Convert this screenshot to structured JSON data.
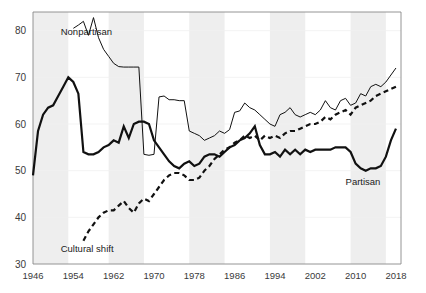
{
  "chart_data": {
    "type": "line",
    "title": "",
    "subtitle": "",
    "xlabel": "",
    "ylabel": "",
    "xlim": [
      1946,
      2019
    ],
    "ylim": [
      30,
      84
    ],
    "grid": false,
    "legend_position": "inline-annotations",
    "xticks": [
      "1946",
      "1954",
      "1962",
      "1970",
      "1978",
      "1986",
      "1994",
      "2002",
      "2010",
      "2018"
    ],
    "xtick_values": [
      1946,
      1954,
      1962,
      1970,
      1978,
      1986,
      1994,
      2002,
      2010,
      2018
    ],
    "yticks": [
      "30",
      "40",
      "50",
      "60",
      "70",
      "80"
    ],
    "ytick_values": [
      30,
      40,
      50,
      60,
      70,
      80
    ],
    "shaded_bands": [
      {
        "start": 1946,
        "end": 1953
      },
      {
        "start": 1961,
        "end": 1968
      },
      {
        "start": 1977,
        "end": 1984
      },
      {
        "start": 1993,
        "end": 2000
      },
      {
        "start": 2009,
        "end": 2016
      }
    ],
    "series": [
      {
        "name": "Nonpartisan",
        "style": "thin-solid",
        "color": "#111111",
        "label_x": 1951.5,
        "label_y": 79.0,
        "x": [
          1954,
          1955,
          1956,
          1957,
          1958,
          1959,
          1960,
          1961,
          1962,
          1963,
          1964,
          1965,
          1966,
          1967,
          1968,
          1969,
          1970,
          1971,
          1972,
          1973,
          1974,
          1975,
          1976,
          1977,
          1978,
          1979,
          1980,
          1981,
          1982,
          1983,
          1984,
          1985,
          1986,
          1987,
          1988,
          1989,
          1990,
          1991,
          1992,
          1993,
          1994,
          1995,
          1996,
          1997,
          1998,
          1999,
          2000,
          2001,
          2002,
          2003,
          2004,
          2005,
          2006,
          2007,
          2008,
          2009,
          2010,
          2011,
          2012,
          2013,
          2014,
          2015,
          2016,
          2017,
          2018
        ],
        "values": [
          80.5,
          81.2,
          82.0,
          79.0,
          82.8,
          78.5,
          76.0,
          74.5,
          73.0,
          72.3,
          72.2,
          72.2,
          72.2,
          72.2,
          53.5,
          53.3,
          53.5,
          65.8,
          66.0,
          65.2,
          65.2,
          65.0,
          65.0,
          58.5,
          58.0,
          57.5,
          56.5,
          57.0,
          57.5,
          58.5,
          58.0,
          58.8,
          62.5,
          62.8,
          64.5,
          63.5,
          63.0,
          62.0,
          61.0,
          60.0,
          59.5,
          62.0,
          62.5,
          63.5,
          62.0,
          61.5,
          62.0,
          62.5,
          62.0,
          63.0,
          65.0,
          63.5,
          63.0,
          65.0,
          65.5,
          64.0,
          64.5,
          66.5,
          66.0,
          68.0,
          68.5,
          68.0,
          69.0,
          70.5,
          72.0
        ]
      },
      {
        "name": "Partisan",
        "style": "thick-solid",
        "color": "#111111",
        "label_x": 2008.0,
        "label_y": 47.0,
        "x": [
          1946,
          1947,
          1948,
          1949,
          1950,
          1951,
          1952,
          1953,
          1954,
          1955,
          1956,
          1957,
          1958,
          1959,
          1960,
          1961,
          1962,
          1963,
          1964,
          1965,
          1966,
          1967,
          1968,
          1969,
          1970,
          1971,
          1972,
          1973,
          1974,
          1975,
          1976,
          1977,
          1978,
          1979,
          1980,
          1981,
          1982,
          1983,
          1984,
          1985,
          1986,
          1987,
          1988,
          1989,
          1990,
          1991,
          1992,
          1993,
          1994,
          1995,
          1996,
          1997,
          1998,
          1999,
          2000,
          2001,
          2002,
          2003,
          2004,
          2005,
          2006,
          2007,
          2008,
          2009,
          2010,
          2011,
          2012,
          2013,
          2014,
          2015,
          2016,
          2017,
          2018
        ],
        "values": [
          49.0,
          58.5,
          62.0,
          63.5,
          64.0,
          66.0,
          68.0,
          70.0,
          69.0,
          66.5,
          54.0,
          53.5,
          53.5,
          54.0,
          55.0,
          55.5,
          56.5,
          56.0,
          59.5,
          57.0,
          60.0,
          60.5,
          60.5,
          60.0,
          56.5,
          55.0,
          53.5,
          52.0,
          51.0,
          50.5,
          51.5,
          52.0,
          51.0,
          51.5,
          53.0,
          53.5,
          53.5,
          53.0,
          54.0,
          55.0,
          55.5,
          56.5,
          57.0,
          58.0,
          59.5,
          55.5,
          53.5,
          53.5,
          54.0,
          53.0,
          54.5,
          53.5,
          54.5,
          53.5,
          54.5,
          54.0,
          54.5,
          54.5,
          54.5,
          54.5,
          55.0,
          55.0,
          55.0,
          54.0,
          51.5,
          50.5,
          50.0,
          50.5,
          50.5,
          51.0,
          53.0,
          56.5,
          59.0
        ]
      },
      {
        "name": "Cultural shift",
        "style": "dashed",
        "color": "#111111",
        "label_x": 1951.5,
        "label_y": 32.5,
        "x": [
          1956,
          1957,
          1958,
          1959,
          1960,
          1961,
          1962,
          1963,
          1964,
          1965,
          1966,
          1967,
          1968,
          1969,
          1970,
          1971,
          1972,
          1973,
          1974,
          1975,
          1976,
          1977,
          1978,
          1979,
          1980,
          1981,
          1982,
          1983,
          1984,
          1985,
          1986,
          1987,
          1988,
          1989,
          1990,
          1991,
          1992,
          1993,
          1994,
          1995,
          1996,
          1997,
          1998,
          1999,
          2000,
          2001,
          2002,
          2003,
          2004,
          2005,
          2006,
          2007,
          2008,
          2009,
          2010,
          2011,
          2012,
          2013,
          2014,
          2015,
          2016,
          2017,
          2018
        ],
        "values": [
          35.0,
          37.0,
          38.5,
          40.0,
          41.0,
          41.5,
          41.5,
          42.5,
          43.5,
          42.0,
          41.0,
          43.0,
          44.0,
          43.5,
          45.0,
          46.5,
          48.0,
          49.0,
          49.5,
          49.5,
          49.0,
          48.0,
          48.0,
          48.5,
          50.0,
          51.0,
          52.5,
          53.5,
          54.5,
          55.0,
          56.0,
          56.5,
          57.5,
          57.0,
          57.5,
          56.5,
          57.5,
          57.0,
          57.5,
          57.0,
          58.0,
          58.5,
          58.5,
          59.0,
          59.5,
          60.0,
          60.0,
          60.5,
          61.5,
          61.0,
          62.0,
          62.5,
          63.0,
          62.0,
          63.5,
          64.0,
          64.5,
          65.0,
          66.0,
          66.5,
          67.0,
          67.5,
          68.0
        ]
      }
    ]
  },
  "figure": {
    "background_color": "#ffffff",
    "band_color": "#eeeeee",
    "axis_color": "#888888",
    "label_color": "#3a3a3a"
  }
}
